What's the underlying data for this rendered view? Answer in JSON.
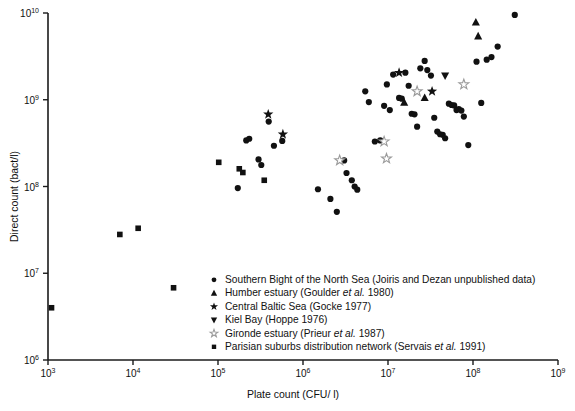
{
  "chart_data": {
    "type": "scatter",
    "title": "",
    "xlabel": "Plate count (CFU/ l)",
    "ylabel": "Direct count (bact/l)",
    "xscale": "log",
    "yscale": "log",
    "xlim": [
      1000,
      1000000000
    ],
    "ylim": [
      1000000,
      10000000000
    ],
    "grid": false,
    "legend_position": "inside-bottom-center",
    "xticks": [
      {
        "value": 1000,
        "label": "10",
        "exp": "3"
      },
      {
        "value": 10000,
        "label": "10",
        "exp": "4"
      },
      {
        "value": 100000,
        "label": "10",
        "exp": "5"
      },
      {
        "value": 1000000,
        "label": "10",
        "exp": "6"
      },
      {
        "value": 10000000,
        "label": "10",
        "exp": "7"
      },
      {
        "value": 100000000,
        "label": "10",
        "exp": "8"
      },
      {
        "value": 1000000000,
        "label": "10",
        "exp": "9"
      }
    ],
    "yticks": [
      {
        "value": 1000000,
        "label": "10",
        "exp": "6"
      },
      {
        "value": 10000000,
        "label": "10",
        "exp": "7"
      },
      {
        "value": 100000000,
        "label": "10",
        "exp": "8"
      },
      {
        "value": 1000000000,
        "label": "10",
        "exp": "9"
      },
      {
        "value": 10000000000,
        "label": "10",
        "exp": "10"
      }
    ],
    "series": [
      {
        "name": "Southern Bight of the North Sea",
        "citation": "(Joiris and Dezan unpublished data)",
        "marker": "circle",
        "filled": true,
        "points": [
          [
            171000,
            96000000
          ],
          [
            215000,
            340000000
          ],
          [
            233000,
            355000000
          ],
          [
            300000,
            205000000
          ],
          [
            323000,
            177000000
          ],
          [
            395000,
            560000000
          ],
          [
            455000,
            295000000
          ],
          [
            570000,
            335000000
          ],
          [
            1500000,
            93000000
          ],
          [
            2100000,
            72000000
          ],
          [
            2500000,
            51000000
          ],
          [
            3050000,
            200000000
          ],
          [
            3250000,
            143000000
          ],
          [
            3750000,
            118000000
          ],
          [
            4050000,
            100000000
          ],
          [
            4350000,
            92000000
          ],
          [
            5400000,
            1250000000
          ],
          [
            5950000,
            940000000
          ],
          [
            7000000,
            330000000
          ],
          [
            8100000,
            340000000
          ],
          [
            9000000,
            850000000
          ],
          [
            9700000,
            1500000000
          ],
          [
            10500000,
            760000000
          ],
          [
            11500000,
            1950000000
          ],
          [
            13500000,
            1050000000
          ],
          [
            14500000,
            1030000000
          ],
          [
            16000000,
            2050000000
          ],
          [
            17500000,
            1450000000
          ],
          [
            19000000,
            690000000
          ],
          [
            20500000,
            680000000
          ],
          [
            22000000,
            490000000
          ],
          [
            24000000,
            2300000000
          ],
          [
            27000000,
            2800000000
          ],
          [
            29000000,
            2200000000
          ],
          [
            32000000,
            1900000000
          ],
          [
            35000000,
            620000000
          ],
          [
            38000000,
            430000000
          ],
          [
            41000000,
            400000000
          ],
          [
            44000000,
            395000000
          ],
          [
            47000000,
            360000000
          ],
          [
            52000000,
            900000000
          ],
          [
            56000000,
            870000000
          ],
          [
            60000000,
            860000000
          ],
          [
            64000000,
            760000000
          ],
          [
            68000000,
            780000000
          ],
          [
            73000000,
            750000000
          ],
          [
            78000000,
            640000000
          ],
          [
            88000000,
            300000000
          ],
          [
            110000000,
            2750000000
          ],
          [
            125000000,
            920000000
          ],
          [
            145000000,
            2900000000
          ],
          [
            165000000,
            3100000000
          ],
          [
            195000000,
            4100000000
          ],
          [
            310000000,
            9500000000
          ]
        ]
      },
      {
        "name": "Humber estuary",
        "citation": "(Goulder et al. 1980)",
        "marker": "triangle-up",
        "filled": true,
        "points": [
          [
            15500000,
            930000000
          ],
          [
            27000000,
            1050000000
          ],
          [
            108000000,
            7800000000
          ],
          [
            115000000,
            5400000000
          ]
        ]
      },
      {
        "name": "Central Baltic Sea",
        "citation": "(Gocke 1977)",
        "marker": "star",
        "filled": true,
        "points": [
          [
            390000,
            680000000
          ],
          [
            580000,
            400000000
          ],
          [
            13500000,
            2050000000
          ],
          [
            33000000,
            1250000000
          ]
        ]
      },
      {
        "name": "Kiel Bay",
        "citation": "(Hoppe 1976)",
        "marker": "triangle-down",
        "filled": true,
        "points": [
          [
            47000000,
            1900000000
          ]
        ]
      },
      {
        "name": "Gironde estuary",
        "citation": "(Prieur et al. 1987)",
        "marker": "star-open",
        "filled": false,
        "points": [
          [
            2700000,
            200000000
          ],
          [
            9000000,
            330000000
          ],
          [
            9600000,
            210000000
          ],
          [
            22000000,
            1250000000
          ],
          [
            78000000,
            1500000000
          ]
        ]
      },
      {
        "name": "Parisian suburbs distribution network",
        "citation": "(Servais et al. 1991)",
        "marker": "square",
        "filled": true,
        "points": [
          [
            1100,
            4000000
          ],
          [
            7000,
            28000000
          ],
          [
            11500,
            33000000
          ],
          [
            30000,
            6800000
          ],
          [
            102000,
            190000000
          ],
          [
            178000,
            160000000
          ],
          [
            196000,
            145000000
          ],
          [
            350000,
            118000000
          ]
        ]
      }
    ]
  },
  "legend": {
    "items": [
      {
        "marker": "circle",
        "name": "Southern Bight of the North Sea",
        "cite_pre": "(Joiris and Dezan unpublished data)",
        "cite_it": "",
        "cite_post": ""
      },
      {
        "marker": "triangle-up",
        "name": "Humber estuary",
        "cite_pre": "(Goulder ",
        "cite_it": "et al.",
        "cite_post": " 1980)"
      },
      {
        "marker": "star",
        "name": "Central Baltic Sea",
        "cite_pre": "(Gocke 1977)",
        "cite_it": "",
        "cite_post": ""
      },
      {
        "marker": "triangle-down",
        "name": "Kiel Bay",
        "cite_pre": "(Hoppe 1976)",
        "cite_it": "",
        "cite_post": ""
      },
      {
        "marker": "star-open",
        "name": "Gironde estuary",
        "cite_pre": "(Prieur ",
        "cite_it": "et al.",
        "cite_post": " 1987)"
      },
      {
        "marker": "square",
        "name": "Parisian suburbs distribution network",
        "cite_pre": "(Servais ",
        "cite_it": "et al.",
        "cite_post": " 1991)"
      }
    ]
  },
  "colors": {
    "marker": "#111111",
    "marker_open_stroke": "#9a9a9a",
    "axis": "#1a1a1a",
    "background": "#ffffff"
  }
}
